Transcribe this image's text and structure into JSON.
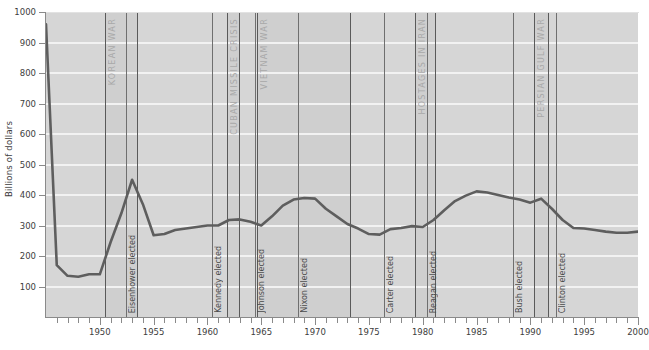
{
  "chart_data": {
    "type": "line",
    "title": "",
    "xlabel": "",
    "ylabel": "Billions of dollars",
    "xlim": [
      1945,
      2000
    ],
    "ylim": [
      0,
      1000
    ],
    "grid": true,
    "legend": "none",
    "y_ticks": [
      100,
      200,
      300,
      400,
      500,
      600,
      700,
      800,
      900,
      1000
    ],
    "x_ticks_major": [
      1950,
      1955,
      1960,
      1965,
      1970,
      1975,
      1980,
      1985,
      1990,
      1995,
      2000
    ],
    "x_ticks_minor": [
      1946,
      1947,
      1948,
      1949,
      1951,
      1952,
      1953,
      1954,
      1956,
      1957,
      1958,
      1959,
      1961,
      1962,
      1963,
      1964,
      1966,
      1967,
      1968,
      1969,
      1971,
      1972,
      1973,
      1974,
      1976,
      1977,
      1978,
      1979,
      1981,
      1982,
      1983,
      1984,
      1986,
      1987,
      1988,
      1989,
      1991,
      1992,
      1993,
      1994,
      1996,
      1997,
      1998,
      1999
    ],
    "series": [
      {
        "name": "Defense spending",
        "color": "#5e5e5e",
        "x": [
          1945,
          1946,
          1947,
          1948,
          1949,
          1950,
          1951,
          1952,
          1953,
          1954,
          1955,
          1956,
          1957,
          1958,
          1959,
          1960,
          1961,
          1962,
          1963,
          1964,
          1965,
          1966,
          1967,
          1968,
          1969,
          1970,
          1971,
          1972,
          1973,
          1974,
          1975,
          1976,
          1977,
          1978,
          1979,
          1980,
          1981,
          1982,
          1983,
          1984,
          1985,
          1986,
          1987,
          1988,
          1989,
          1990,
          1991,
          1992,
          1993,
          1994,
          1995,
          1996,
          1997,
          1998,
          1999,
          2000
        ],
        "y": [
          960,
          170,
          135,
          132,
          140,
          140,
          245,
          340,
          450,
          370,
          268,
          272,
          285,
          290,
          295,
          300,
          300,
          318,
          320,
          312,
          300,
          330,
          365,
          385,
          390,
          388,
          355,
          330,
          305,
          290,
          272,
          270,
          288,
          292,
          298,
          295,
          318,
          350,
          380,
          398,
          412,
          408,
          400,
          392,
          385,
          375,
          388,
          355,
          318,
          292,
          290,
          285,
          280,
          276,
          276,
          280
        ]
      }
    ],
    "era_bands": [
      {
        "label": "KOREAN WAR",
        "start": 1950.5,
        "end": 1953.5
      },
      {
        "label": "CUBAN MISSILE CRISIS",
        "start": 1961.8,
        "end": 1962.9
      },
      {
        "label": "VIETNAM WAR",
        "start": 1964.6,
        "end": 1973.2
      },
      {
        "label": "HOSTAGES IN IRAN",
        "start": 1979.3,
        "end": 1981.1
      },
      {
        "label": "PERSIAN GULF WAR",
        "start": 1990.3,
        "end": 1991.6
      }
    ],
    "event_lines": [
      {
        "label": "KOREAN WAR",
        "year": 1950.5,
        "kind": "era"
      },
      {
        "label": "KOREAN WAR",
        "year": 1953.5,
        "kind": "era"
      },
      {
        "label": "CUBAN MISSILE CRISIS",
        "year": 1961.8,
        "kind": "era"
      },
      {
        "label": "CUBAN MISSILE CRISIS",
        "year": 1962.9,
        "kind": "era"
      },
      {
        "label": "VIETNAM WAR",
        "year": 1964.6,
        "kind": "era"
      },
      {
        "label": "VIETNAM WAR",
        "year": 1973.2,
        "kind": "era"
      },
      {
        "label": "HOSTAGES IN IRAN",
        "year": 1979.3,
        "kind": "era"
      },
      {
        "label": "HOSTAGES IN IRAN",
        "year": 1981.1,
        "kind": "era"
      },
      {
        "label": "PERSIAN GULF WAR",
        "year": 1990.3,
        "kind": "era"
      },
      {
        "label": "PERSIAN GULF WAR",
        "year": 1991.6,
        "kind": "era"
      }
    ],
    "president_markers": [
      {
        "label": "Eisenhower elected",
        "year": 1952.4
      },
      {
        "label": "Kennedy elected",
        "year": 1960.4
      },
      {
        "label": "Johnson elected",
        "year": 1964.4
      },
      {
        "label": "Nixon elected",
        "year": 1968.4
      },
      {
        "label": "Carter elected",
        "year": 1976.4
      },
      {
        "label": "Reagan elected",
        "year": 1980.4
      },
      {
        "label": "Bush elected",
        "year": 1988.4
      },
      {
        "label": "Clinton elected",
        "year": 1992.4
      }
    ],
    "annotations": [
      "KOREAN WAR",
      "CUBAN MISSILE CRISIS",
      "VIETNAM WAR",
      "HOSTAGES IN IRAN",
      "PERSIAN GULF WAR",
      "Eisenhower elected",
      "Kennedy elected",
      "Johnson elected",
      "Nixon elected",
      "Carter elected",
      "Reagan elected",
      "Bush elected",
      "Clinton elected"
    ],
    "colors": {
      "line": "#5e5e5e",
      "plot_background": "#d6d6d6",
      "band_background": "#cfcfcf",
      "gridline": "#f2f2f2",
      "axis": "#8a8a8a",
      "era_text": "#a9a9a9",
      "president_text": "#4a4a4a"
    }
  }
}
